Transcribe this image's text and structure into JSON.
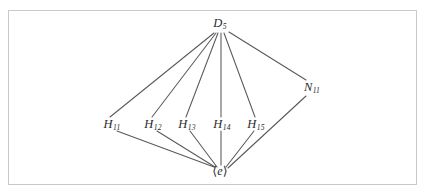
{
  "figure": {
    "kind": "lattice-diagram",
    "caption": "",
    "frame": {
      "border_color": "#c9c9c9",
      "fill_color": "#ffffff"
    },
    "edge_color": "#595959",
    "label_color": "#2b2b2b"
  },
  "chart_data": {
    "type": "diagram",
    "title": "",
    "subtitle": "",
    "xlabel": "",
    "ylabel": "",
    "grid": false,
    "legend": "none",
    "nodes": [
      {
        "id": "D5",
        "base": "D",
        "subscript": "5",
        "label": "D5",
        "x": 220,
        "y": 24,
        "level": "top"
      },
      {
        "id": "H11",
        "base": "H",
        "subscript": "11",
        "label": "H11",
        "x": 112,
        "y": 125,
        "level": "middle"
      },
      {
        "id": "H12",
        "base": "H",
        "subscript": "12",
        "label": "H12",
        "x": 153,
        "y": 125,
        "level": "middle"
      },
      {
        "id": "H13",
        "base": "H",
        "subscript": "13",
        "label": "H13",
        "x": 187,
        "y": 125,
        "level": "middle"
      },
      {
        "id": "H14",
        "base": "H",
        "subscript": "14",
        "label": "H14",
        "x": 222,
        "y": 125,
        "level": "middle"
      },
      {
        "id": "H15",
        "base": "H",
        "subscript": "15",
        "label": "H15",
        "x": 256,
        "y": 125,
        "level": "middle"
      },
      {
        "id": "N11",
        "base": "N",
        "subscript": "11",
        "label": "N11",
        "x": 312,
        "y": 88,
        "level": "middle"
      },
      {
        "id": "e",
        "base": "e",
        "subscript": "",
        "label": "<e>",
        "x": 220,
        "y": 171,
        "level": "bottom"
      }
    ],
    "edges": [
      {
        "from": "D5",
        "to": "H11",
        "x1": 214,
        "y1": 33,
        "x2": 110,
        "y2": 117
      },
      {
        "from": "D5",
        "to": "H12",
        "x1": 216,
        "y1": 33,
        "x2": 152,
        "y2": 117
      },
      {
        "from": "D5",
        "to": "H13",
        "x1": 218,
        "y1": 33,
        "x2": 186,
        "y2": 117
      },
      {
        "from": "D5",
        "to": "H14",
        "x1": 221,
        "y1": 33,
        "x2": 221,
        "y2": 117
      },
      {
        "from": "D5",
        "to": "H15",
        "x1": 224,
        "y1": 33,
        "x2": 255,
        "y2": 117
      },
      {
        "from": "D5",
        "to": "N11",
        "x1": 229,
        "y1": 32,
        "x2": 306,
        "y2": 80
      },
      {
        "from": "H11",
        "to": "e",
        "x1": 117,
        "y1": 131,
        "x2": 214,
        "y2": 167
      },
      {
        "from": "H12",
        "to": "e",
        "x1": 157,
        "y1": 131,
        "x2": 215,
        "y2": 167
      },
      {
        "from": "H13",
        "to": "e",
        "x1": 190,
        "y1": 131,
        "x2": 217,
        "y2": 167
      },
      {
        "from": "H14",
        "to": "e",
        "x1": 221,
        "y1": 131,
        "x2": 221,
        "y2": 165
      },
      {
        "from": "H15",
        "to": "e",
        "x1": 254,
        "y1": 131,
        "x2": 226,
        "y2": 167
      },
      {
        "from": "N11",
        "to": "e",
        "x1": 306,
        "y1": 96,
        "x2": 228,
        "y2": 168
      }
    ]
  }
}
